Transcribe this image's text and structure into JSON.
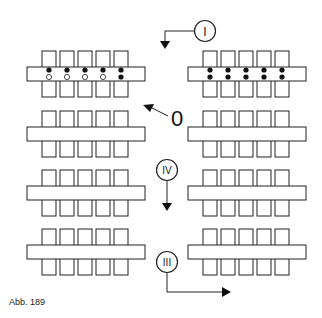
{
  "figure": {
    "caption": "Abb. 189",
    "colors": {
      "line": "#222222",
      "fill": "#ffffff",
      "dot": "#111111"
    },
    "markers": [
      {
        "id": "I",
        "label": "I"
      },
      {
        "id": "0",
        "label": "0"
      },
      {
        "id": "IV",
        "label": "IV"
      },
      {
        "id": "III",
        "label": "III"
      }
    ],
    "blocks": [
      {
        "row": 1,
        "side": "left",
        "dots": "upper filled, lower hollow (last both filled)"
      },
      {
        "row": 1,
        "side": "right",
        "dots": "both filled"
      },
      {
        "row": 2,
        "side": "left"
      },
      {
        "row": 2,
        "side": "right"
      },
      {
        "row": 3,
        "side": "left"
      },
      {
        "row": 3,
        "side": "right"
      },
      {
        "row": 4,
        "side": "left"
      },
      {
        "row": 4,
        "side": "right"
      }
    ]
  }
}
